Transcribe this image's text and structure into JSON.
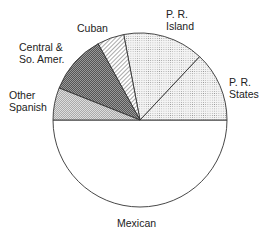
{
  "chart_data": {
    "type": "pie",
    "title": "",
    "unit": "percent (estimated from slice angles)",
    "categories": [
      "Mexican",
      "P. R. States",
      "P. R. Island",
      "Cuban",
      "Central & So. Amer.",
      "Other Spanish"
    ],
    "values": [
      50,
      13,
      15,
      5,
      11,
      6
    ],
    "patterns": {
      "Mexican": "white",
      "P. R. States": "fine-dots",
      "P. R. Island": "fine-dots",
      "Cuban": "diagonal-hatch",
      "Central & So. Amer.": "dark-crosshatch",
      "Other Spanish": "medium-crosshatch"
    },
    "legend": "none (direct labels)"
  },
  "labels": {
    "mexican": "Mexican",
    "pr_states": "P. R.\nStates",
    "pr_island": "P. R.\nIsland",
    "cuban": "Cuban",
    "central": "Central &\nSo. Amer.",
    "other": "Other\nSpanish"
  }
}
